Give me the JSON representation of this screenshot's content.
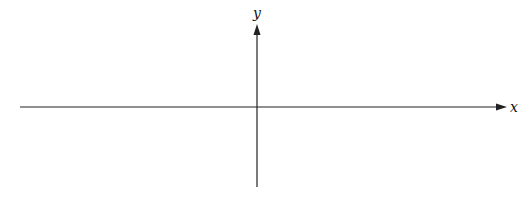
{
  "diagram": {
    "type": "coordinate-axes",
    "x_axis": {
      "label": "x",
      "direction": "right",
      "arrow": true
    },
    "y_axis": {
      "label": "y",
      "direction": "up",
      "arrow": true
    },
    "colors": {
      "axis": "#222222",
      "background": "#ffffff"
    }
  }
}
